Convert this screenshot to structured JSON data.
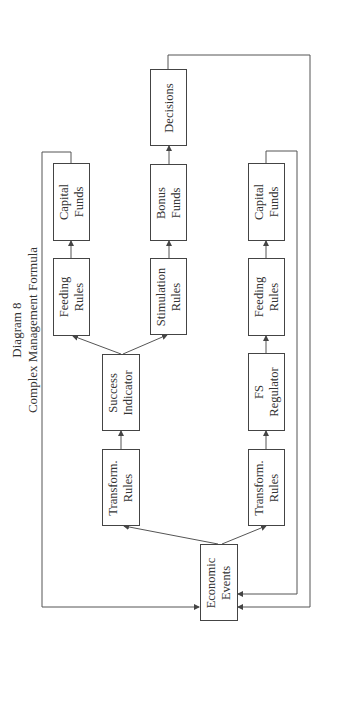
{
  "title": {
    "line1": "Diagram 8",
    "line2": "Complex Management Formula"
  },
  "nodes": {
    "capital_funds_top": {
      "line1": "Capital",
      "line2": "Funds"
    },
    "feeding_rules_top": {
      "line1": "Feeding",
      "line2": "Rules"
    },
    "success_indicator": {
      "line1": "Success",
      "line2": "Indicator"
    },
    "transform_rules_top": {
      "line1": "Transform.",
      "line2": "Rules"
    },
    "decisions": {
      "line1": "Decisions",
      "line2": ""
    },
    "bonus_funds": {
      "line1": "Bonus",
      "line2": "Funds"
    },
    "stimulation_rules": {
      "line1": "Stimulation",
      "line2": "Rules"
    },
    "economic_events": {
      "line1": "Economic",
      "line2": "Events"
    },
    "capital_funds_bottom": {
      "line1": "Capital",
      "line2": "Funds"
    },
    "feeding_rules_bottom": {
      "line1": "Feeding",
      "line2": "Rules"
    },
    "fs_regulator": {
      "line1": "FS",
      "line2": "Regulator"
    },
    "transform_rules_bottom": {
      "line1": "Transform.",
      "line2": "Rules"
    }
  },
  "edges": [
    {
      "from": "Economic Events",
      "to": "Transform. Rules (top)"
    },
    {
      "from": "Economic Events",
      "to": "Transform. Rules (bottom)"
    },
    {
      "from": "Transform. Rules (top)",
      "to": "Success Indicator"
    },
    {
      "from": "Success Indicator",
      "to": "Feeding Rules (top)"
    },
    {
      "from": "Success Indicator",
      "to": "Stimulation Rules"
    },
    {
      "from": "Feeding Rules (top)",
      "to": "Capital Funds (top)"
    },
    {
      "from": "Stimulation Rules",
      "to": "Bonus Funds"
    },
    {
      "from": "Bonus Funds",
      "to": "Decisions"
    },
    {
      "from": "Transform. Rules (bottom)",
      "to": "FS Regulator"
    },
    {
      "from": "FS Regulator",
      "to": "Feeding Rules (bottom)"
    },
    {
      "from": "Feeding Rules (bottom)",
      "to": "Capital Funds (bottom)"
    },
    {
      "from": "Capital Funds (top)",
      "to": "Economic Events"
    },
    {
      "from": "Capital Funds (bottom)",
      "to": "Economic Events"
    },
    {
      "from": "Decisions",
      "to": "Economic Events"
    }
  ],
  "colors": {
    "line": "#444444",
    "text": "#333333",
    "background": "#ffffff"
  }
}
